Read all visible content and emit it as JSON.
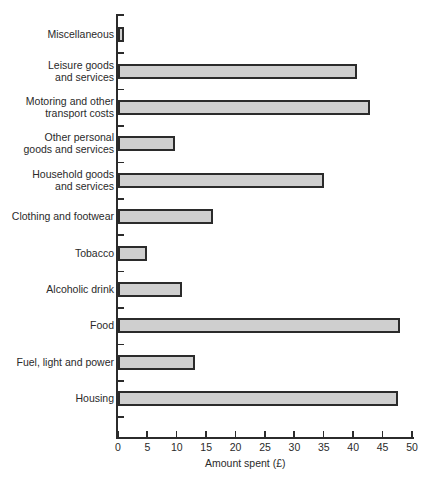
{
  "chart_data": {
    "type": "bar",
    "orientation": "horizontal",
    "title": "",
    "xlabel": "Amount spent (£)",
    "ylabel": "",
    "xlim": [
      0,
      50
    ],
    "x_ticks": [
      "0",
      "5",
      "10",
      "15",
      "20",
      "25",
      "30",
      "35",
      "40",
      "45",
      "50"
    ],
    "grid": false,
    "legend": null,
    "categories": [
      "Miscellaneous",
      "Leisure goods and services",
      "Motoring and other transport costs",
      "Other personal goods and services",
      "Household goods and services",
      "Clothing and footwear",
      "Tobacco",
      "Alcoholic drink",
      "Food",
      "Fuel, light and power",
      "Housing"
    ],
    "values": [
      1.0,
      40.6,
      42.9,
      9.7,
      35.0,
      16.2,
      4.9,
      10.9,
      47.9,
      13.1,
      47.6
    ],
    "bar_color": "#cfcfcf",
    "edge_color": "#2b2b2b"
  },
  "labels": [
    [
      "Miscellaneous"
    ],
    [
      "Leisure goods",
      "and services"
    ],
    [
      "Motoring and other",
      "transport costs"
    ],
    [
      "Other personal",
      "goods and services"
    ],
    [
      "Household goods",
      "and services"
    ],
    [
      "Clothing and footwear"
    ],
    [
      "Tobacco"
    ],
    [
      "Alcoholic drink"
    ],
    [
      "Food"
    ],
    [
      "Fuel, light and power"
    ],
    [
      "Housing"
    ]
  ]
}
